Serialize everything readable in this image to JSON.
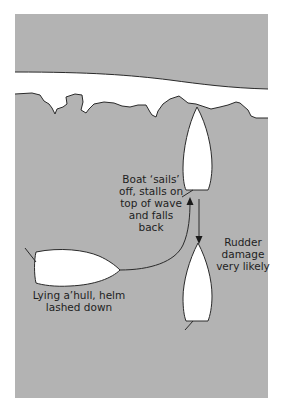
{
  "figure": {
    "type": "sailing-diagram",
    "colors": {
      "sea": "#b3b3b3",
      "outline": "#2a2a2a",
      "hull": "#ffffff",
      "background": "#ffffff",
      "text": "#1e1e1e"
    }
  },
  "labels": {
    "sails_off": [
      "Boat ‘sails’",
      "off, stalls on",
      "top of wave",
      "and falls",
      "back"
    ],
    "rudder_damage": [
      "Rudder",
      "damage",
      "very likely"
    ],
    "lying_ahull": [
      "Lying a’hull, helm",
      "lashed down"
    ]
  },
  "elements": {
    "boats": [
      {
        "name": "boat-lying-ahull",
        "orientation": "bow-right"
      },
      {
        "name": "boat-on-wave-top",
        "orientation": "bow-up"
      },
      {
        "name": "boat-falling-back",
        "orientation": "bow-up"
      }
    ],
    "arrows": [
      {
        "name": "path-arrow",
        "direction": "up",
        "description": "curved path from lying boat to wave top"
      },
      {
        "name": "fall-back-arrow",
        "direction": "down"
      }
    ]
  }
}
